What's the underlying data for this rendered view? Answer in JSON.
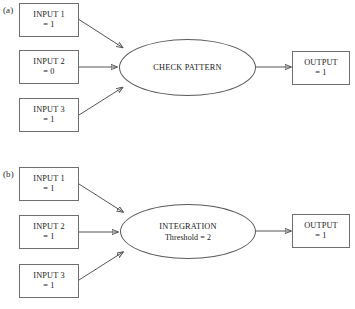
{
  "figure": {
    "background_color": "#ffffff",
    "line_color": "#555555",
    "box_border_color": "#6e6e6e",
    "text_color": "#181818"
  },
  "panels": [
    {
      "label": "(a)",
      "inputs": [
        {
          "line1": "INPUT 1",
          "line2": "= 1"
        },
        {
          "line1": "INPUT 2",
          "line2": "= 0"
        },
        {
          "line1": "INPUT 3",
          "line2": "= 1"
        }
      ],
      "process": {
        "line1": "CHECK PATTERN",
        "line2": ""
      },
      "output": {
        "line1": "OUTPUT",
        "line2": "= 1"
      }
    },
    {
      "label": "(b)",
      "inputs": [
        {
          "line1": "INPUT 1",
          "line2": "= 1"
        },
        {
          "line1": "INPUT 2",
          "line2": "= 1"
        },
        {
          "line1": "INPUT 3",
          "line2": "= 1"
        }
      ],
      "process": {
        "line1": "INTEGRATION",
        "line2": "Threshold = 2"
      },
      "output": {
        "line1": "OUTPUT",
        "line2": "= 1"
      }
    }
  ]
}
